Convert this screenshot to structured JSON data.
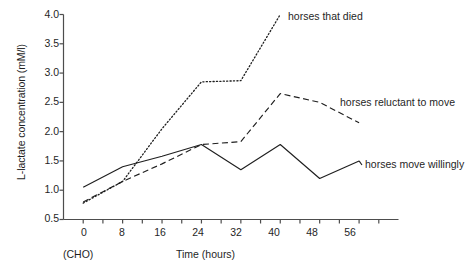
{
  "chart_data": {
    "type": "line",
    "title": "",
    "xlabel": "Time (hours)",
    "ylabel": "L-lactate concentration (mM/l)",
    "xlim": [
      -4,
      64
    ],
    "ylim": [
      0.5,
      4.0
    ],
    "grid": false,
    "legend_position": "inline-right-of-series",
    "x_ticks": [
      0,
      8,
      16,
      24,
      32,
      40,
      48,
      56
    ],
    "x_tick_labels": [
      "0",
      "8",
      "16",
      "24",
      "32",
      "40",
      "48",
      "56"
    ],
    "x_minor_ticks": [
      4,
      12,
      20,
      28,
      36,
      44,
      52,
      60
    ],
    "y_ticks": [
      0.5,
      1.0,
      1.5,
      2.0,
      2.5,
      3.0,
      3.5,
      4.0
    ],
    "y_tick_labels": [
      "0.5",
      "1.0",
      "1.5",
      "2.0",
      "2.5",
      "3.0",
      "3.5",
      "4.0"
    ],
    "x_origin_annotation": "(CHO)",
    "series": [
      {
        "name": "horses that died",
        "style": "dotted",
        "x": [
          0,
          8,
          16,
          24,
          32,
          40
        ],
        "values": [
          0.78,
          1.15,
          2.05,
          2.85,
          2.87,
          4.0
        ]
      },
      {
        "name": "horses reluctant to move",
        "style": "dashed",
        "x": [
          0,
          8,
          16,
          24,
          32,
          40,
          48,
          56
        ],
        "values": [
          0.8,
          1.15,
          1.45,
          1.78,
          1.83,
          2.65,
          2.5,
          2.15
        ]
      },
      {
        "name": "horses move willingly",
        "style": "solid",
        "x": [
          0,
          8,
          16,
          24,
          32,
          40,
          48,
          56
        ],
        "values": [
          1.05,
          1.4,
          1.58,
          1.78,
          1.35,
          1.78,
          1.2,
          1.5
        ]
      }
    ]
  },
  "labels": {
    "died": "horses that died",
    "reluctant": "horses reluctant to move",
    "willing": "horses move willingly"
  },
  "axes": {
    "y_title": "L-lactate concentration (mM/l)",
    "x_title": "Time (hours)",
    "cho": "(CHO)"
  },
  "colors": {
    "ink": "#1f1f1f",
    "axis": "#4d4d4d",
    "background": "#ffffff"
  }
}
